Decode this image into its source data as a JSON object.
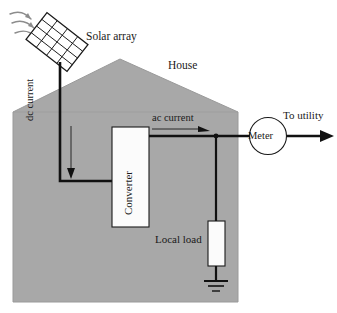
{
  "diagram": {
    "colors": {
      "house_fill": "#a8a8a8",
      "house_stroke": "#8f8f8f",
      "wire": "#111111",
      "thin_line": "#1a1a1a",
      "ray": "#8c8c8c",
      "box_fill": "#fbfbfb",
      "background": "#ffffff"
    },
    "labels": {
      "solar_array": "Solar array",
      "house": "House",
      "dc_current": "dc current",
      "ac_current": "ac current",
      "converter": "Converter",
      "meter": "Meter",
      "to_utility": "To utility",
      "local_load": "Local load"
    },
    "components": [
      {
        "name": "solar-array-panel",
        "type": "pv-panel",
        "grid_rows": 4,
        "grid_cols": 4,
        "rotation_deg": 38
      },
      {
        "name": "house-body",
        "type": "pentagon-outline"
      },
      {
        "name": "converter-box",
        "type": "rectangle"
      },
      {
        "name": "meter-circle",
        "type": "circle"
      },
      {
        "name": "local-load-resistor",
        "type": "rectangle"
      },
      {
        "name": "ground-symbol",
        "type": "earth-ground",
        "bars": 3
      }
    ],
    "flows": [
      {
        "name": "sun-rays",
        "count": 3,
        "direction": "down-right",
        "style": "curved-arrow"
      },
      {
        "name": "dc-flow",
        "label": "dc current",
        "direction": "down"
      },
      {
        "name": "ac-flow",
        "label": "ac current",
        "direction": "right"
      },
      {
        "name": "utility-export",
        "label": "To utility",
        "direction": "right"
      }
    ]
  }
}
